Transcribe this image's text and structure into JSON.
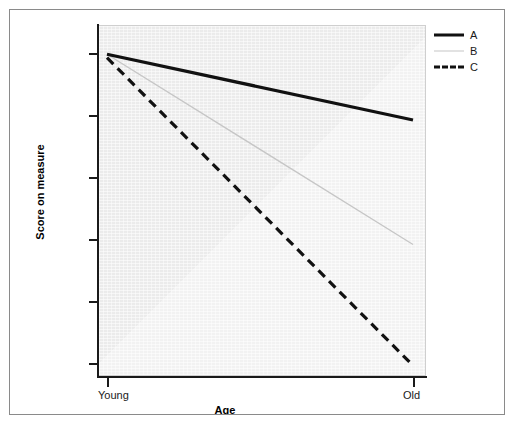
{
  "figure": {
    "background_color": "#ffffff",
    "frame_color": "#8a8a8a",
    "panel_color": "#eeeeee"
  },
  "axes": {
    "x_title": "Age",
    "y_title": "Score on measure",
    "x_tick_labels": [
      "Young",
      "Old"
    ],
    "y_tick_labels": [
      "",
      "",
      "",
      "",
      "",
      ""
    ]
  },
  "legend": {
    "entries": [
      {
        "label": "A",
        "style": "solid-thick",
        "color": "#111111"
      },
      {
        "label": "B",
        "style": "solid-thin",
        "color": "#c6c6c6"
      },
      {
        "label": "C",
        "style": "dashed-thick",
        "color": "#111111"
      }
    ]
  },
  "chart_data": {
    "type": "line",
    "title": "",
    "subtitle": "",
    "xlabel": "Age",
    "ylabel": "Score on measure",
    "x": [
      "Young",
      "Old"
    ],
    "categories": [
      "Young",
      "Old"
    ],
    "xlim": [
      0,
      1
    ],
    "ylim": [
      0,
      1
    ],
    "grid": false,
    "legend_position": "top-right",
    "annotations": [],
    "axis_tick_labels": {
      "x": [
        "Young",
        "Old"
      ],
      "y": [
        "",
        "",
        "",
        "",
        "",
        ""
      ]
    },
    "series": [
      {
        "name": "A",
        "style": "solid",
        "width": 3,
        "color": "#111111",
        "values": [
          0.93,
          0.74
        ]
      },
      {
        "name": "B",
        "style": "solid",
        "width": 1,
        "color": "#c6c6c6",
        "values": [
          0.93,
          0.38
        ]
      },
      {
        "name": "C",
        "style": "dashed",
        "width": 3,
        "color": "#111111",
        "values": [
          0.92,
          0.03
        ]
      }
    ]
  }
}
